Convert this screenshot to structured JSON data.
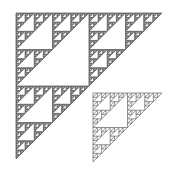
{
  "image": {
    "width": 176,
    "height": 177,
    "background": "#ffffff",
    "description": "Two right-angled Sierpinski-style fractal triangles with the right angle at the top-left; a large dense one and a smaller sparser one overlapping its lower-right."
  },
  "fractals": [
    {
      "name": "large-triangle",
      "corner": [
        16,
        13
      ],
      "size": 146,
      "depth": 6,
      "stroke": "#555555",
      "fill": "#8a8a8a"
    },
    {
      "name": "small-triangle",
      "corner": [
        93,
        93
      ],
      "size": 69,
      "depth": 4,
      "stroke": "#666666",
      "fill": "none"
    }
  ]
}
